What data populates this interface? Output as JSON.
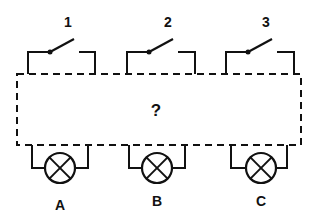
{
  "diagram": {
    "type": "circuit",
    "unknown_box_label": "?",
    "switches": [
      {
        "id": "switch-1",
        "label": "1",
        "state": "open"
      },
      {
        "id": "switch-2",
        "label": "2",
        "state": "open"
      },
      {
        "id": "switch-3",
        "label": "3",
        "state": "open"
      }
    ],
    "lamps": [
      {
        "id": "lamp-a",
        "label": "A"
      },
      {
        "id": "lamp-b",
        "label": "B"
      },
      {
        "id": "lamp-c",
        "label": "C"
      }
    ],
    "colors": {
      "line": "#111111",
      "background": "#ffffff"
    }
  }
}
